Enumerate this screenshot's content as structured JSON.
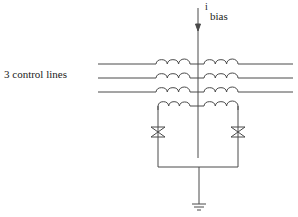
{
  "diagram": {
    "type": "circuit-schematic",
    "labels": {
      "control_lines": "3 control lines",
      "current_symbol": "i",
      "current_subscript": "bias"
    },
    "components": {
      "control_line_count": 3,
      "coil_pairs": 4,
      "josephson_junctions": 2,
      "ground": 1
    },
    "colors": {
      "line": "#4a4a4a",
      "background": "#ffffff",
      "text": "#222222"
    }
  }
}
